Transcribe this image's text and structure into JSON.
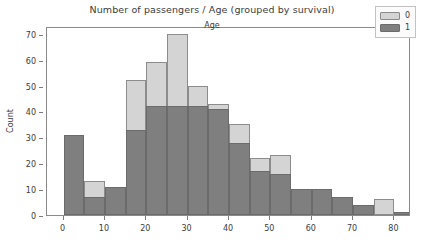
{
  "chart_data": {
    "type": "bar",
    "title": "Number of passengers / Age (grouped by survival)",
    "xlabel": "Age",
    "ylabel": "Count",
    "xlim": [
      -4,
      84
    ],
    "ylim": [
      0,
      73
    ],
    "xticks": [
      0,
      10,
      20,
      30,
      40,
      50,
      60,
      70,
      80
    ],
    "yticks": [
      0,
      10,
      20,
      30,
      40,
      50,
      60,
      70
    ],
    "grid": false,
    "legend_position": "upper right",
    "bin_edges": [
      0,
      5,
      10,
      15,
      20,
      25,
      30,
      35,
      40,
      45,
      50,
      55,
      60,
      65,
      70,
      75,
      80
    ],
    "bin_centers": [
      2.5,
      7.5,
      12.5,
      17.5,
      22.5,
      27.5,
      32.5,
      37.5,
      42.5,
      47.5,
      52.5,
      57.5,
      62.5,
      67.5,
      72.5,
      77.5
    ],
    "overlap": "overlaid",
    "colors": {
      "series_0": "#d4d4d4",
      "series_1": "#7f7f7f",
      "edge": "#7a7a7a",
      "text": "#3b3b3b",
      "axis": "#8a8a8a",
      "background": "#ffffff"
    },
    "series": [
      {
        "name": "0",
        "label": "0",
        "color": "#d4d4d4",
        "values": [
          13,
          13,
          11,
          52,
          59,
          70,
          50,
          43,
          35,
          22,
          23,
          10,
          10,
          7,
          4,
          6,
          0
        ]
      },
      {
        "name": "1",
        "label": "1",
        "color": "#7f7f7f",
        "values": [
          31,
          7,
          11,
          33,
          42,
          42,
          42,
          41,
          28,
          17,
          16,
          10,
          10,
          7,
          4,
          0,
          1
        ]
      }
    ]
  },
  "legend": {
    "entries": [
      {
        "label": "0",
        "color": "#d4d4d4"
      },
      {
        "label": "1",
        "color": "#7f7f7f"
      }
    ]
  }
}
